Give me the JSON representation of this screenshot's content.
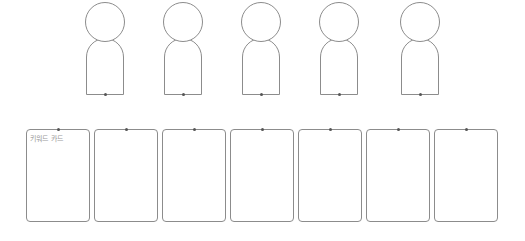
{
  "figures": [
    {
      "id": 1,
      "label": ""
    },
    {
      "id": 2,
      "label": ""
    },
    {
      "id": 3,
      "label": ""
    },
    {
      "id": 4,
      "label": ""
    },
    {
      "id": 5,
      "label": ""
    }
  ],
  "cards": [
    {
      "id": 1,
      "label": "키워드 카드"
    },
    {
      "id": 2,
      "label": ""
    },
    {
      "id": 3,
      "label": ""
    },
    {
      "id": 4,
      "label": ""
    },
    {
      "id": 5,
      "label": ""
    },
    {
      "id": 6,
      "label": ""
    },
    {
      "id": 7,
      "label": ""
    }
  ],
  "colors": {
    "stroke": "#8c8c8c",
    "label": "#9a9a9a",
    "background": "#ffffff"
  }
}
